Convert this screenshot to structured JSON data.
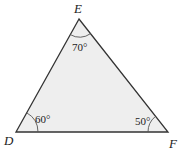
{
  "diagram": {
    "type": "triangle",
    "fill_color": "#eeeeee",
    "stroke_color": "#333333",
    "vertices": [
      {
        "name": "E",
        "angle": "70°"
      },
      {
        "name": "D",
        "angle": "60°"
      },
      {
        "name": "F",
        "angle": "50°"
      }
    ]
  }
}
